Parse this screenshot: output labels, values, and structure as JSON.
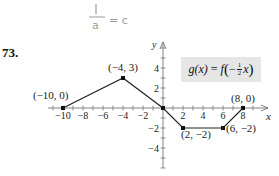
{
  "handwriting": {
    "numerator": "1",
    "denominator": "a",
    "rhs": "= c",
    "color": "#9a9a9a"
  },
  "problem_number": "73.",
  "formula": {
    "lhs": "g(x)",
    "eq": "=",
    "f": "f",
    "open": "(",
    "sign": "−",
    "num": "1",
    "den": "2",
    "var": "x",
    "close": ")"
  },
  "chart_data": {
    "type": "line",
    "xlabel": "x",
    "ylabel": "y",
    "xlim": [
      -11,
      10.5
    ],
    "ylim": [
      -6,
      6.5
    ],
    "x_ticks": [
      -10,
      -8,
      -6,
      -4,
      -2,
      2,
      4,
      6,
      8
    ],
    "x_tick_labels": [
      "−10",
      "−8",
      "−6",
      "−4",
      "−2",
      "2",
      "4",
      "6",
      "8"
    ],
    "y_ticks": [
      4,
      2,
      -2,
      -4
    ],
    "y_tick_labels": [
      "4",
      "2",
      "−2",
      "−4"
    ],
    "grid": false,
    "series": [
      {
        "name": "g(x)",
        "x": [
          -10,
          -4,
          0,
          2,
          6,
          8
        ],
        "y": [
          0,
          3,
          0,
          -2,
          -2,
          0
        ]
      }
    ],
    "annotations": [
      {
        "point": [
          -10,
          0
        ],
        "label": "(−10, 0)"
      },
      {
        "point": [
          -4,
          3
        ],
        "label": "(−4, 3)"
      },
      {
        "point": [
          2,
          -2
        ],
        "label": "(2, −2)"
      },
      {
        "point": [
          6,
          -2
        ],
        "label": "(6, −2)"
      },
      {
        "point": [
          8,
          0
        ],
        "label": "(8, 0)"
      }
    ]
  }
}
